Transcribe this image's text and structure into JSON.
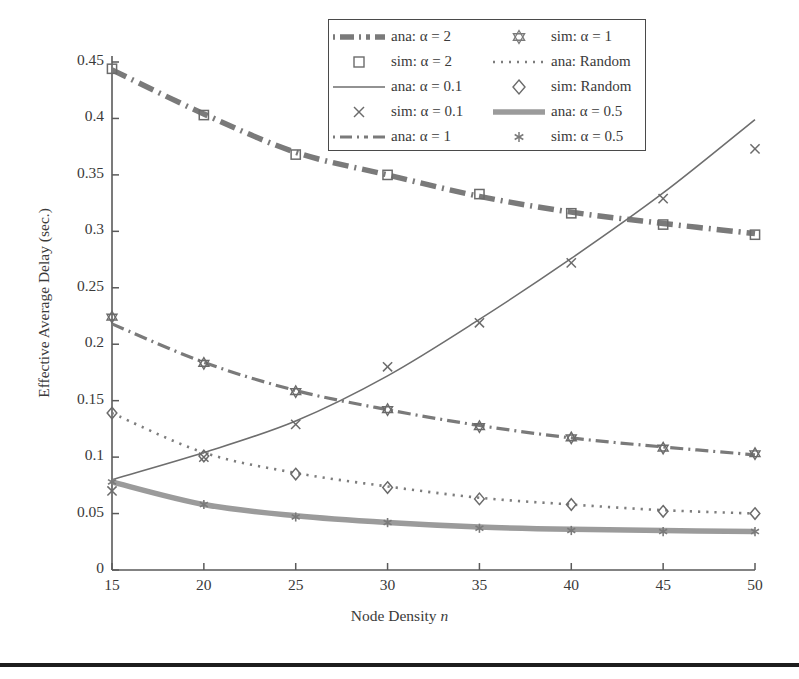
{
  "chart_data": {
    "type": "line",
    "title": "",
    "xlabel": "Node Density n",
    "ylabel": "Effective Average Delay (sec.)",
    "x": [
      15,
      20,
      25,
      30,
      35,
      40,
      45,
      50
    ],
    "xlim": [
      15,
      50
    ],
    "ylim": [
      0,
      0.45
    ],
    "xticks": [
      "15",
      "20",
      "25",
      "30",
      "35",
      "40",
      "45",
      "50"
    ],
    "yticks": [
      "0",
      "0.05",
      "0.1",
      "0.15",
      "0.2",
      "0.25",
      "0.3",
      "0.35",
      "0.4",
      "0.45"
    ],
    "ytick_values": [
      0,
      0.05,
      0.1,
      0.15,
      0.2,
      0.25,
      0.3,
      0.35,
      0.4,
      0.45
    ],
    "grid": false,
    "legend_position": "top-center",
    "series": [
      {
        "name": "ana: alpha = 2",
        "label": "ana: α = 2",
        "style": "dashdot-thick",
        "color": "#7a7a7a",
        "marker": "none",
        "values": [
          0.443,
          0.404,
          0.37,
          0.35,
          0.331,
          0.317,
          0.307,
          0.298
        ]
      },
      {
        "name": "sim: alpha = 2",
        "label": "sim: α = 2",
        "style": "none",
        "color": "#6b6b6b",
        "marker": "square",
        "values": [
          0.444,
          0.403,
          0.368,
          0.35,
          0.333,
          0.316,
          0.306,
          0.297
        ]
      },
      {
        "name": "ana: alpha = 0.1",
        "label": "ana: α = 0.1",
        "style": "solid-thin",
        "color": "#6e6e6e",
        "marker": "none",
        "values": [
          0.08,
          0.104,
          0.132,
          0.172,
          0.222,
          0.276,
          0.334,
          0.399
        ]
      },
      {
        "name": "sim: alpha = 0.1",
        "label": "sim: α = 0.1",
        "style": "none",
        "color": "#6b6b6b",
        "marker": "cross",
        "values": [
          0.07,
          0.1,
          0.129,
          0.18,
          0.219,
          0.272,
          0.329,
          0.373
        ]
      },
      {
        "name": "ana: alpha = 1",
        "label": "ana: α = 1",
        "style": "dashdot-medium",
        "color": "#7a7a7a",
        "marker": "none",
        "values": [
          0.218,
          0.184,
          0.159,
          0.142,
          0.128,
          0.117,
          0.109,
          0.102
        ]
      },
      {
        "name": "sim: alpha = 1",
        "label": "sim: α = 1",
        "style": "none",
        "color": "#6b6b6b",
        "marker": "hexagram",
        "values": [
          0.224,
          0.183,
          0.158,
          0.142,
          0.127,
          0.117,
          0.108,
          0.103
        ]
      },
      {
        "name": "ana: Random",
        "label": "ana: Random",
        "style": "dotted",
        "color": "#7d7d7d",
        "marker": "none",
        "values": [
          0.139,
          0.104,
          0.086,
          0.074,
          0.064,
          0.058,
          0.053,
          0.05
        ]
      },
      {
        "name": "sim: Random",
        "label": "sim: Random",
        "style": "none",
        "color": "#6b6b6b",
        "marker": "diamond",
        "values": [
          0.139,
          0.101,
          0.085,
          0.073,
          0.063,
          0.058,
          0.052,
          0.05
        ]
      },
      {
        "name": "ana: alpha = 0.5",
        "label": "ana: α = 0.5",
        "style": "solid-thick",
        "color": "#9b9b9b",
        "marker": "none",
        "values": [
          0.078,
          0.058,
          0.048,
          0.042,
          0.038,
          0.036,
          0.035,
          0.034
        ]
      },
      {
        "name": "sim: alpha = 0.5",
        "label": "sim: α = 0.5",
        "style": "none",
        "color": "#7a7a7a",
        "marker": "asterisk",
        "values": [
          0.078,
          0.058,
          0.047,
          0.042,
          0.037,
          0.035,
          0.034,
          0.034
        ]
      }
    ]
  },
  "axes": {
    "x_title_prefix": "Node Density ",
    "x_title_italic": "n",
    "y_title": "Effective Average Delay (sec.)"
  },
  "legend": {
    "left_column": [
      {
        "sample": "dashdot-thick-line-sample",
        "label": "ana: α = 2"
      },
      {
        "sample": "square-marker-sample",
        "label": "sim: α = 2"
      },
      {
        "sample": "solid-thin-line-sample",
        "label": "ana: α = 0.1"
      },
      {
        "sample": "cross-marker-sample",
        "label": "sim: α = 0.1"
      },
      {
        "sample": "dashdot-medium-line-sample",
        "label": "ana: α = 1"
      }
    ],
    "right_column": [
      {
        "sample": "hexagram-marker-sample",
        "label": "sim: α = 1"
      },
      {
        "sample": "dotted-line-sample",
        "label": "ana: Random"
      },
      {
        "sample": "diamond-marker-sample",
        "label": "sim: Random"
      },
      {
        "sample": "solid-thick-line-sample",
        "label": "ana: α = 0.5"
      },
      {
        "sample": "asterisk-marker-sample",
        "label": "sim: α = 0.5"
      }
    ]
  },
  "colors": {
    "axis": "#5a5a5a",
    "text": "#3a3a3a",
    "line_gray": "#7a7a7a",
    "line_light_gray": "#9b9b9b",
    "rule": "#1d1d1d"
  }
}
